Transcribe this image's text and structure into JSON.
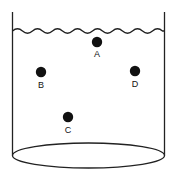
{
  "figure": {
    "container": {
      "shape": "open-cylinder",
      "left_wall_x": 12.5,
      "right_wall_x": 164.5,
      "wall_top_y": 12,
      "base_ellipse_center_x": 88.5,
      "base_ellipse_center_y": 155.5,
      "base_ellipse_rx": 76,
      "base_ellipse_ry": 12.5,
      "line_color": "#222222",
      "line_width": 1.3,
      "fill_color": "#ffffff"
    },
    "liquid_surface": {
      "label": "wavy water surface line",
      "baseline_y": 31,
      "amplitude": 3.2,
      "wavelength": 20,
      "start_x": 12.5,
      "end_x": 164.5,
      "line_color": "#222222",
      "line_width": 1.3
    },
    "particles": [
      {
        "id": "A",
        "label": "A",
        "cx": 97,
        "cy": 42,
        "r": 5.2,
        "color": "#111111",
        "label_x": 97,
        "label_y": 50
      },
      {
        "id": "B",
        "label": "B",
        "cx": 41,
        "cy": 72,
        "r": 5.2,
        "color": "#111111",
        "label_x": 41,
        "label_y": 81
      },
      {
        "id": "C",
        "label": "C",
        "cx": 68,
        "cy": 117,
        "r": 5.2,
        "color": "#111111",
        "label_x": 68,
        "label_y": 126
      },
      {
        "id": "D",
        "label": "D",
        "cx": 135,
        "cy": 71,
        "r": 5.2,
        "color": "#111111",
        "label_x": 135,
        "label_y": 80
      }
    ]
  }
}
